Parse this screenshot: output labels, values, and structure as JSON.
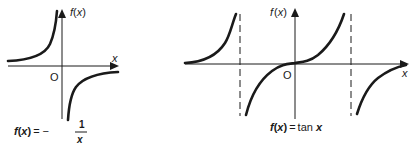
{
  "figures": [
    {
      "id": "reciprocal",
      "axis_y_label_f": "f",
      "axis_y_label_paren_open": "(",
      "axis_y_label_var": "x",
      "axis_y_label_paren_close": ")",
      "axis_x_label": "x",
      "origin_label": "O",
      "caption_lhs_f": "f",
      "caption_lhs_open": "(",
      "caption_lhs_var": "x",
      "caption_lhs_close": ")",
      "caption_eq": "=",
      "caption_minus": "−",
      "caption_num": "1",
      "caption_den": "x"
    },
    {
      "id": "tangent",
      "axis_y_label_f": "f",
      "axis_y_label_paren_open": "(",
      "axis_y_label_var": "x",
      "axis_y_label_paren_close": ")",
      "axis_x_label": "x",
      "origin_label": "O",
      "caption_lhs_f": "f",
      "caption_lhs_open": "(",
      "caption_lhs_var": "x",
      "caption_lhs_close": ")",
      "caption_eq": "=",
      "caption_fn": "tan",
      "caption_var": "x"
    }
  ],
  "colors": {
    "ink": "#1a1a1a",
    "background": "#ffffff"
  }
}
